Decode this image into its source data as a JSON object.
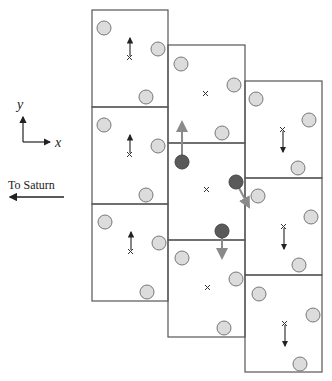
{
  "axes": {
    "y_label": "y",
    "x_label": "x"
  },
  "saturn": {
    "label": "To Saturn"
  },
  "colors": {
    "box_stroke": "#555555",
    "particle_fill": "#dcdcdc",
    "particle_stroke": "#777777",
    "highlight_fill": "#5a5a5a",
    "gray_arrow": "#8a8a8a",
    "black_arrow": "#222222"
  },
  "columns": [
    {
      "x": 92,
      "cells": [
        10,
        107,
        204
      ],
      "arrow": "up"
    },
    {
      "x": 168,
      "cells": [
        45,
        143,
        240
      ],
      "arrow": "none"
    },
    {
      "x": 245,
      "cells": [
        81,
        178,
        275
      ],
      "arrow": "down"
    }
  ],
  "cell_size": {
    "w": 77,
    "h": 97
  },
  "highlighted_particles": [
    {
      "x": 182,
      "y": 162,
      "arrow": "up"
    },
    {
      "x": 236,
      "y": 183,
      "arrow": "down-right"
    },
    {
      "x": 223,
      "y": 231,
      "arrow": "down"
    }
  ]
}
